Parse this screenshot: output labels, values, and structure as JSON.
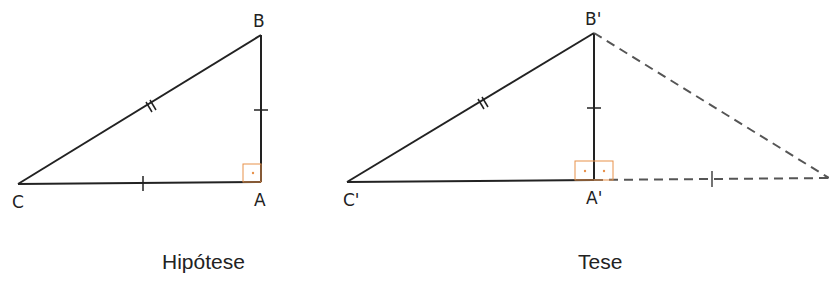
{
  "figures": [
    {
      "caption": "Hipótese",
      "vertices": {
        "A": "A",
        "B": "B",
        "C": "C"
      }
    },
    {
      "caption": "Tese",
      "vertices": {
        "A": "A'",
        "B": "B'",
        "C": "C'"
      }
    }
  ],
  "colors": {
    "line": "#222222",
    "dashed": "#555555",
    "right_angle": "#e8914a"
  }
}
